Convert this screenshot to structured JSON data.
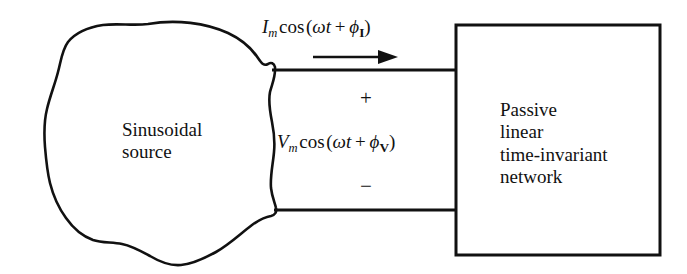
{
  "figure": {
    "background_color": "#ffffff",
    "line_color": "#111111",
    "source": {
      "label_line1": "Sinusoidal",
      "label_line2": "source"
    },
    "network": {
      "label_line1": "Passive",
      "label_line2": "linear",
      "label_line3": "time-invariant",
      "label_line4": "network"
    },
    "current": {
      "symbol": "I",
      "subscript": "m",
      "function": "cos",
      "open_paren": "(",
      "omega": "ω",
      "time": "t",
      "plus": "+",
      "phi": "ϕ",
      "phase_subscript": "I",
      "close_paren": ")"
    },
    "voltage": {
      "symbol": "V",
      "subscript": "m",
      "function": "cos",
      "open_paren": "(",
      "omega": "ω",
      "time": "t",
      "plus": "+",
      "phi": "ϕ",
      "phase_subscript": "V",
      "close_paren": ")"
    },
    "polarity": {
      "plus": "+",
      "minus": "−"
    }
  }
}
